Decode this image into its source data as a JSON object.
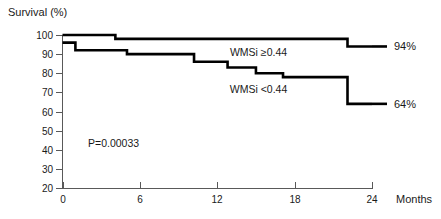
{
  "chart_data": {
    "type": "line",
    "subtype": "kaplan-meier-step",
    "title": "",
    "ylabel": "Survival (%)",
    "xlabel": "Months",
    "xlim": [
      0,
      24
    ],
    "ylim": [
      20,
      100
    ],
    "grid": false,
    "legend_position": "inline-annotation",
    "x_ticks": [
      0,
      6,
      12,
      18,
      24
    ],
    "x_tick_labels": [
      "0",
      "6",
      "12",
      "18",
      "24"
    ],
    "y_ticks": [
      20,
      30,
      40,
      50,
      60,
      70,
      80,
      90,
      100
    ],
    "y_tick_labels": [
      "20",
      "30",
      "40",
      "50",
      "60",
      "70",
      "80",
      "90",
      "100"
    ],
    "annotations": [
      {
        "name": "p-value",
        "text": "P=0.00033",
        "x": 3.0,
        "y": 43
      }
    ],
    "series": [
      {
        "name": "WMSi ≥0.44",
        "label": "WMSi ≥0.44",
        "endpoint_label": "94%",
        "final_value": 94,
        "color": "#000000",
        "label_x": 15.2,
        "label_y": 91,
        "steps": [
          {
            "x": 0.0,
            "y": 100
          },
          {
            "x": 4.1,
            "y": 100
          },
          {
            "x": 4.1,
            "y": 98
          },
          {
            "x": 22.1,
            "y": 98
          },
          {
            "x": 22.1,
            "y": 94
          },
          {
            "x": 24.0,
            "y": 94
          }
        ]
      },
      {
        "name": "WMSi <0.44",
        "label": "WMSi <0.44",
        "endpoint_label": "64%",
        "final_value": 64,
        "color": "#000000",
        "label_x": 15.2,
        "label_y": 72,
        "steps": [
          {
            "x": 0.0,
            "y": 96
          },
          {
            "x": 1.0,
            "y": 96
          },
          {
            "x": 1.0,
            "y": 92
          },
          {
            "x": 5.0,
            "y": 92
          },
          {
            "x": 5.0,
            "y": 90
          },
          {
            "x": 10.2,
            "y": 90
          },
          {
            "x": 10.2,
            "y": 86
          },
          {
            "x": 12.8,
            "y": 86
          },
          {
            "x": 12.8,
            "y": 83
          },
          {
            "x": 15.0,
            "y": 83
          },
          {
            "x": 15.0,
            "y": 80
          },
          {
            "x": 17.1,
            "y": 80
          },
          {
            "x": 17.1,
            "y": 78
          },
          {
            "x": 22.1,
            "y": 78
          },
          {
            "x": 22.1,
            "y": 64
          },
          {
            "x": 24.0,
            "y": 64
          }
        ]
      }
    ]
  }
}
